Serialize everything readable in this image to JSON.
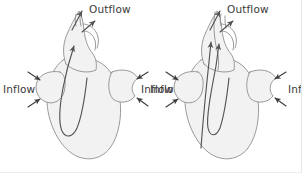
{
  "figure": {
    "background_color": "#ffffff",
    "organ_fill_color": "#f2f2f2",
    "organ_outline_color": "#8f8f8f",
    "arrow_color": "#545454",
    "label_color": "#3a3a3a"
  },
  "diagrams": [
    {
      "id": "left-heart",
      "name": "Single-circuit heart",
      "labels": {
        "outflow": "Outflow",
        "inflow_left": "Inflow",
        "inflow_right": "Inflow"
      },
      "flow_paths": 1,
      "arrow_count": {
        "outflow_arrows": 2,
        "inflow_arrows_left": 2,
        "inflow_arrows_right": 2,
        "internal_flow_arrows": 1
      }
    },
    {
      "id": "right-heart",
      "name": "Dual-circuit heart",
      "labels": {
        "outflow": "Outflow",
        "inflow_left": "Inflow",
        "inflow_right": "Inflow"
      },
      "flow_paths": 2,
      "arrow_count": {
        "outflow_arrows": 2,
        "inflow_arrows_left": 2,
        "inflow_arrows_right": 2,
        "internal_flow_arrows": 2
      }
    }
  ]
}
